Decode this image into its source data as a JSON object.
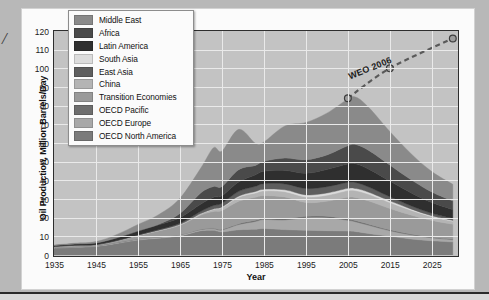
{
  "page": {
    "left_margin_glyph": "/",
    "background_color": "#b8b8b8"
  },
  "chart_card": {
    "background_color": "#fbfbfb"
  },
  "legend": {
    "items": [
      {
        "label": "Middle East",
        "color": "#8a8a8a"
      },
      {
        "label": "Africa",
        "color": "#4a4a4a"
      },
      {
        "label": "Latin America",
        "color": "#2f2f2f"
      },
      {
        "label": "South Asia",
        "color": "#dcdcdc"
      },
      {
        "label": "East Asia",
        "color": "#5e5e5e"
      },
      {
        "label": "China",
        "color": "#b4b4b4"
      },
      {
        "label": "Transition Economies",
        "color": "#9a9a9a"
      },
      {
        "label": "OECD Pacific",
        "color": "#6e6e6e"
      },
      {
        "label": "OECD Europe",
        "color": "#a8a8a8"
      },
      {
        "label": "OECD North America",
        "color": "#7b7b7b"
      }
    ]
  },
  "annotations": {
    "weo_label": "WEO 2006"
  },
  "chart_data": {
    "type": "area",
    "stacked": true,
    "title": "",
    "xlabel": "Year",
    "ylabel": "Oil Production, Million Barrels/Day",
    "xlim": [
      1935,
      2031
    ],
    "ylim": [
      0,
      120
    ],
    "xticks": [
      1935,
      1945,
      1955,
      1965,
      1975,
      1985,
      1995,
      2005,
      2015,
      2025
    ],
    "yticks": [
      0,
      10,
      20,
      30,
      40,
      50,
      60,
      70,
      80,
      90,
      100,
      110,
      120
    ],
    "grid": true,
    "legend_position": "top-left-inside",
    "plot_background": "#c3c3c3",
    "x": [
      1935,
      1940,
      1945,
      1950,
      1955,
      1960,
      1965,
      1970,
      1973,
      1975,
      1979,
      1983,
      1985,
      1990,
      1995,
      2000,
      2005,
      2007,
      2010,
      2015,
      2020,
      2025,
      2030
    ],
    "series": [
      {
        "name": "OECD North America",
        "color": "#7b7b7b",
        "values": [
          3.6,
          4.1,
          4.6,
          6.2,
          8.0,
          9.0,
          10.2,
          13.0,
          13.2,
          12.4,
          13.5,
          13.8,
          14.2,
          13.6,
          13.2,
          13.0,
          12.8,
          12.5,
          11.5,
          10.0,
          8.6,
          7.6,
          7.0
        ]
      },
      {
        "name": "OECD Europe",
        "color": "#a8a8a8",
        "values": [
          0.3,
          0.3,
          0.3,
          0.4,
          0.5,
          0.6,
          0.6,
          0.6,
          0.8,
          1.0,
          2.8,
          4.2,
          4.8,
          5.2,
          6.8,
          7.0,
          5.8,
          5.2,
          4.4,
          3.0,
          2.2,
          1.6,
          1.2
        ]
      },
      {
        "name": "OECD Pacific",
        "color": "#6e6e6e",
        "values": [
          0.05,
          0.05,
          0.05,
          0.05,
          0.1,
          0.1,
          0.1,
          0.2,
          0.3,
          0.4,
          0.5,
          0.6,
          0.6,
          0.7,
          0.7,
          0.8,
          0.7,
          0.6,
          0.6,
          0.5,
          0.4,
          0.3,
          0.3
        ]
      },
      {
        "name": "Transition Economies",
        "color": "#9a9a9a",
        "values": [
          0.5,
          0.6,
          0.5,
          0.9,
          1.8,
          3.2,
          5.0,
          7.6,
          9.0,
          10.0,
          12.0,
          12.4,
          12.2,
          11.6,
          7.4,
          8.0,
          11.6,
          12.4,
          12.4,
          11.4,
          10.2,
          9.0,
          8.0
        ]
      },
      {
        "name": "China",
        "color": "#b4b4b4",
        "values": [
          0.02,
          0.02,
          0.02,
          0.05,
          0.1,
          0.2,
          0.3,
          0.6,
          1.1,
          1.5,
          2.1,
          2.2,
          2.5,
          2.8,
          3.0,
          3.2,
          3.6,
          3.7,
          3.6,
          3.2,
          2.6,
          2.0,
          1.6
        ]
      },
      {
        "name": "South Asia",
        "color": "#dcdcdc",
        "values": [
          0.02,
          0.02,
          0.02,
          0.03,
          0.05,
          0.1,
          0.1,
          0.2,
          0.3,
          0.4,
          0.6,
          0.8,
          0.9,
          1.0,
          1.1,
          1.2,
          1.2,
          1.2,
          1.1,
          0.9,
          0.7,
          0.5,
          0.4
        ]
      },
      {
        "name": "East Asia",
        "color": "#5e5e5e",
        "values": [
          0.05,
          0.1,
          0.05,
          0.1,
          0.2,
          0.4,
          0.7,
          1.2,
          1.8,
          2.0,
          2.6,
          2.8,
          3.0,
          3.2,
          3.4,
          3.4,
          3.2,
          3.1,
          2.8,
          2.2,
          1.7,
          1.3,
          1.0
        ]
      },
      {
        "name": "Latin America",
        "color": "#2f2f2f",
        "values": [
          0.5,
          0.7,
          0.9,
          1.4,
          2.0,
          2.6,
          3.0,
          3.9,
          4.4,
          4.0,
          5.0,
          6.2,
          6.6,
          7.2,
          8.2,
          9.2,
          9.8,
          10.0,
          9.6,
          8.4,
          7.0,
          5.8,
          4.8
        ]
      },
      {
        "name": "Africa",
        "color": "#4a4a4a",
        "values": [
          0.02,
          0.03,
          0.03,
          0.1,
          0.2,
          0.3,
          2.2,
          6.0,
          5.8,
          5.0,
          6.6,
          5.0,
          5.4,
          6.6,
          7.2,
          7.8,
          9.8,
          10.4,
          10.0,
          8.6,
          7.0,
          5.6,
          4.6
        ]
      },
      {
        "name": "Middle East",
        "color": "#8a8a8a",
        "values": [
          0.3,
          0.4,
          0.7,
          1.8,
          3.4,
          5.2,
          8.2,
          13.4,
          20.8,
          19.0,
          21.6,
          11.8,
          10.4,
          17.2,
          20.0,
          22.4,
          25.0,
          25.4,
          23.0,
          18.0,
          14.0,
          11.0,
          9.0
        ]
      }
    ],
    "projection": {
      "name": "WEO 2006",
      "style": "dashed",
      "marker": "circle",
      "color": "#5a5a5a",
      "points": [
        {
          "x": 2005,
          "y": 84
        },
        {
          "x": 2015,
          "y": 100
        },
        {
          "x": 2030,
          "y": 116
        }
      ]
    }
  }
}
